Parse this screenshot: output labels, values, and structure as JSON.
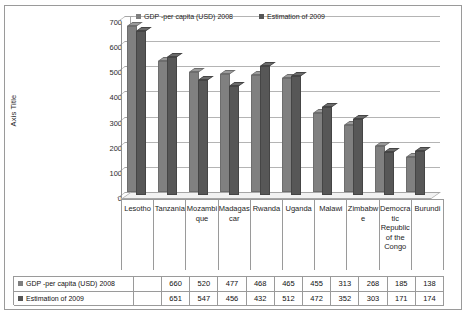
{
  "chart": {
    "axis_title": "Axis Title",
    "legend": [
      {
        "label": "GDP -per capita (USD) 2008",
        "color": "#808080",
        "swatch_icon": "square-marker-icon"
      },
      {
        "label": "Estimation of 2009",
        "color": "#575757",
        "swatch_icon": "square-marker-icon"
      }
    ]
  },
  "chart_data": {
    "type": "bar",
    "title": "",
    "xlabel": "",
    "ylabel": "Axis Title",
    "ylim": [
      0,
      700
    ],
    "yticks": [
      0,
      100,
      200,
      300,
      400,
      500,
      600,
      700
    ],
    "ytick_labels": [
      "0",
      "100",
      "200",
      "300",
      "400",
      "500",
      "600",
      "700"
    ],
    "grid": true,
    "legend_position": "top",
    "categories": [
      "Lesotho",
      "Tanzania",
      "Mozambique",
      "Madagascar",
      "Rwanda",
      "Uganda",
      "Malawi",
      "Zimbabwe",
      "Democratic Republic of the Congo",
      "Burundi"
    ],
    "series": [
      {
        "name": "GDP -per capita (USD) 2008",
        "color": "#808080",
        "values": [
          660,
          520,
          477,
          468,
          465,
          455,
          313,
          268,
          185,
          138
        ]
      },
      {
        "name": "Estimation of 2009",
        "color": "#575757",
        "values": [
          651,
          547,
          456,
          432,
          512,
          472,
          352,
          303,
          171,
          174
        ]
      }
    ]
  }
}
